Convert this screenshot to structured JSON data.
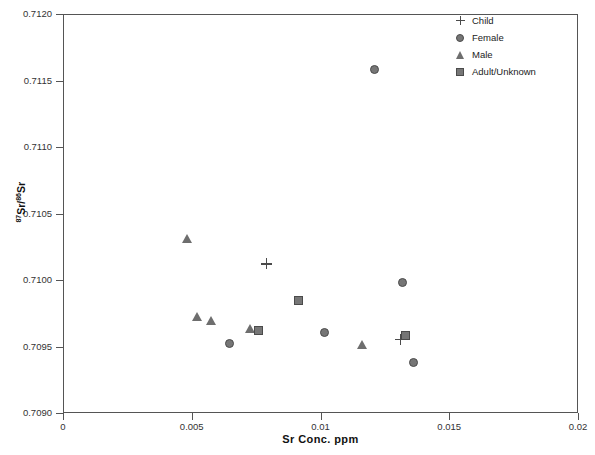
{
  "chart_data": {
    "type": "scatter",
    "title": "",
    "xlabel": "Sr Conc. ppm",
    "ylabel_html": "87Sr/86Sr",
    "ylabel_numerator": "87",
    "ylabel_denominator": "86",
    "ylabel_sr1": "Sr/",
    "ylabel_sr2": "Sr",
    "xlim": [
      0,
      0.02
    ],
    "ylim": [
      0.709,
      0.712
    ],
    "xticks": [
      0,
      0.005,
      0.01,
      0.015,
      0.02
    ],
    "xtick_labels": [
      "0",
      "0.005",
      "0.01",
      "0.015",
      "0.02"
    ],
    "yticks": [
      0.709,
      0.7095,
      0.71,
      0.7105,
      0.711,
      0.7115,
      0.712
    ],
    "ytick_labels": [
      "0.7090",
      "0.7095",
      "0.7100",
      "0.7105",
      "0.7110",
      "0.7115",
      "0.7120"
    ],
    "grid": false,
    "legend_position": "top-right",
    "marker_color": "#767676",
    "marker_edge_color": "#4b4b4b",
    "series": [
      {
        "name": "Child",
        "marker": "cross",
        "points": [
          {
            "x": 0.00785,
            "y": 0.71013
          },
          {
            "x": 0.01305,
            "y": 0.70956
          }
        ]
      },
      {
        "name": "Female",
        "marker": "circle",
        "points": [
          {
            "x": 0.01207,
            "y": 0.71159
          },
          {
            "x": 0.01313,
            "y": 0.70999
          },
          {
            "x": 0.0101,
            "y": 0.70961
          },
          {
            "x": 0.00641,
            "y": 0.70953
          },
          {
            "x": 0.01358,
            "y": 0.70939
          }
        ]
      },
      {
        "name": "Male",
        "marker": "triangle",
        "points": [
          {
            "x": 0.00478,
            "y": 0.71032
          },
          {
            "x": 0.00517,
            "y": 0.70973
          },
          {
            "x": 0.00571,
            "y": 0.7097
          },
          {
            "x": 0.00722,
            "y": 0.70964
          },
          {
            "x": 0.01157,
            "y": 0.70952
          }
        ]
      },
      {
        "name": "Adult/Unknown",
        "marker": "square",
        "points": [
          {
            "x": 0.00912,
            "y": 0.70985
          },
          {
            "x": 0.00757,
            "y": 0.70963
          },
          {
            "x": 0.01328,
            "y": 0.70959
          }
        ]
      }
    ]
  },
  "legend": {
    "items": [
      {
        "label": "Child",
        "marker": "cross"
      },
      {
        "label": "Female",
        "marker": "circle"
      },
      {
        "label": "Male",
        "marker": "triangle"
      },
      {
        "label": "Adult/Unknown",
        "marker": "square"
      }
    ]
  }
}
